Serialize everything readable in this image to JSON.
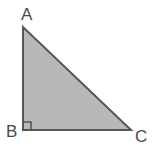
{
  "figure": {
    "kind": "geometry-diagram",
    "shape": "right-triangle",
    "width": 155,
    "height": 147,
    "background_color": "#ffffff",
    "fill_color": "#b8b8b8",
    "stroke_color": "#555555",
    "stroke_width": 2,
    "label_color": "#4a4a4a"
  },
  "vertices": [
    {
      "id": "A",
      "label": "A",
      "x": 23,
      "y": 27,
      "label_x": 21,
      "label_y": 6
    },
    {
      "id": "B",
      "label": "B",
      "x": 23,
      "y": 130,
      "label_x": 6,
      "label_y": 123
    },
    {
      "id": "C",
      "label": "C",
      "x": 131,
      "y": 130,
      "label_x": 135,
      "label_y": 128
    }
  ],
  "right_angle": {
    "at_vertex": "B",
    "marker": "square",
    "size": 8,
    "stroke_color": "#555555"
  },
  "polygon_points": "23,27 23,130 131,130",
  "edges": [
    {
      "id": "AB",
      "from": "A",
      "to": "B",
      "role": "vertical-leg"
    },
    {
      "id": "BC",
      "from": "B",
      "to": "C",
      "role": "horizontal-leg"
    },
    {
      "id": "CA",
      "from": "C",
      "to": "A",
      "role": "hypotenuse"
    }
  ]
}
